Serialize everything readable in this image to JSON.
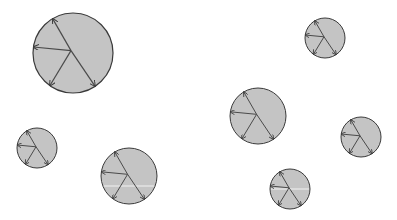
{
  "canvas": {
    "width": 397,
    "height": 220,
    "background": "#ffffff"
  },
  "style": {
    "circle_fill": "#c4c4c4",
    "circle_stroke": "#3a3a3a",
    "line_color": "#4a4a4a",
    "highlight_line": "#f2f2f2"
  },
  "pattern": {
    "hub": [
      -0.05,
      -0.06
    ],
    "rays": [
      {
        "name": "ray-top",
        "end": [
          -0.51,
          -0.86
        ]
      },
      {
        "name": "ray-left",
        "end": [
          -0.99,
          -0.15
        ]
      },
      {
        "name": "ray-lower-left",
        "end": [
          -0.58,
          0.82
        ]
      },
      {
        "name": "ray-lower-right",
        "end": [
          0.55,
          0.83
        ]
      }
    ]
  },
  "circles": [
    {
      "id": "circle-large-top-left",
      "cx": 73,
      "cy": 53,
      "r": 40,
      "highlight_y": null
    },
    {
      "id": "circle-small-left",
      "cx": 37,
      "cy": 148,
      "r": 20,
      "highlight_y": null
    },
    {
      "id": "circle-medium-bottom",
      "cx": 129,
      "cy": 176,
      "r": 28,
      "highlight_y": 186
    },
    {
      "id": "circle-medium-center-right",
      "cx": 258,
      "cy": 116,
      "r": 28,
      "highlight_y": null
    },
    {
      "id": "circle-small-top-right",
      "cx": 325,
      "cy": 38,
      "r": 20,
      "highlight_y": null
    },
    {
      "id": "circle-small-right",
      "cx": 361,
      "cy": 137,
      "r": 20,
      "highlight_y": null
    },
    {
      "id": "circle-small-bottom-right",
      "cx": 290,
      "cy": 189,
      "r": 20,
      "highlight_y": 189
    }
  ]
}
